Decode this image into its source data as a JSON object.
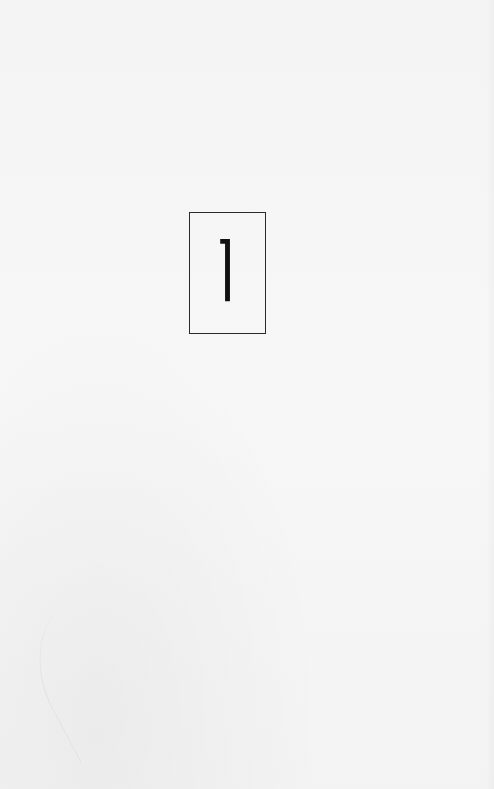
{
  "page": {
    "background_color": "#f5f5f5",
    "boxed_number": {
      "value": "1",
      "border_color": "#2a2a2a",
      "glyph_color": "#111111"
    }
  }
}
